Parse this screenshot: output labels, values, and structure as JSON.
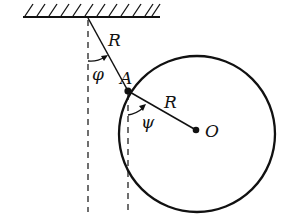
{
  "diagram": {
    "type": "physics-pendulum-with-disk",
    "labels": {
      "rod_length": "R",
      "disk_radius": "R",
      "point_a": "A",
      "center": "O",
      "angle_phi": "φ",
      "angle_psi": "ψ"
    },
    "colors": {
      "stroke": "#111111",
      "background": "#ffffff"
    },
    "geometry": {
      "ceiling": {
        "x1": 23,
        "x2": 160,
        "y": 17
      },
      "pivot": {
        "x": 88,
        "y": 18
      },
      "point_a": {
        "x": 128,
        "y": 91
      },
      "center_o": {
        "x": 196,
        "y": 130
      },
      "circle_radius": 78
    }
  }
}
